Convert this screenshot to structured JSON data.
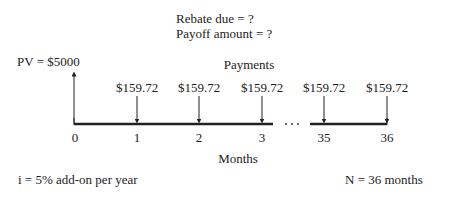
{
  "header": {
    "rebate_line": "Rebate due = ?",
    "payoff_line": "Payoff amount = ?"
  },
  "pv_label": "PV = $5000",
  "payments_title": "Payments",
  "payments": [
    {
      "period": "1",
      "amount": "$159.72"
    },
    {
      "period": "2",
      "amount": "$159.72"
    },
    {
      "period": "3",
      "amount": "$159.72"
    },
    {
      "period": "35",
      "amount": "$159.72"
    },
    {
      "period": "36",
      "amount": "$159.72"
    }
  ],
  "ticks": [
    "0",
    "1",
    "2",
    "3",
    "35",
    "36"
  ],
  "ellipsis": "· · ·",
  "axis_label": "Months",
  "interest_note": "i = 5% add-on per year",
  "term_note": "N = 36 months",
  "colors": {
    "line": "#222222",
    "background": "#ffffff"
  }
}
